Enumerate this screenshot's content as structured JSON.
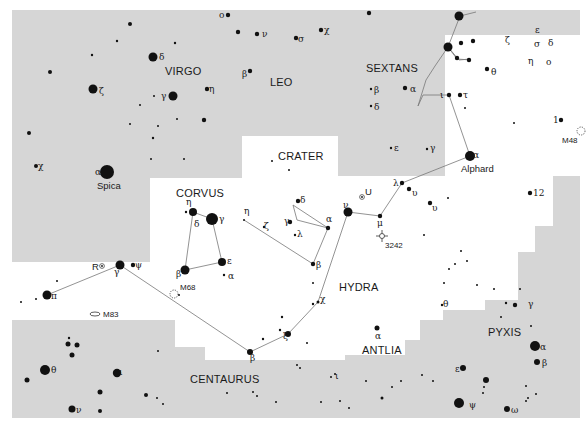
{
  "map": {
    "colors": {
      "outside_region": "#d6d6d6",
      "inside_region": "#ffffff",
      "star": "#111111",
      "figure_line": "#777777",
      "text": "#1a1a1a"
    },
    "constellation_labels": [
      {
        "id": "virgo",
        "text": "VIRGO"
      },
      {
        "id": "leo",
        "text": "LEO"
      },
      {
        "id": "sextans",
        "text": "SEXTANS"
      },
      {
        "id": "crater",
        "text": "CRATER"
      },
      {
        "id": "corvus",
        "text": "CORVUS"
      },
      {
        "id": "hydra",
        "text": "HYDRA"
      },
      {
        "id": "antlia",
        "text": "ANTLIA"
      },
      {
        "id": "pyxis",
        "text": "PYXIS"
      },
      {
        "id": "centaurus",
        "text": "CENTAURUS"
      }
    ],
    "named_stars": [
      {
        "id": "spica",
        "text": "Spica"
      },
      {
        "id": "alphard",
        "text": "Alphard"
      }
    ],
    "deep_sky_objects": [
      {
        "id": "m48",
        "text": "M48",
        "type": "open-cluster"
      },
      {
        "id": "m68",
        "text": "M68",
        "type": "globular-cluster"
      },
      {
        "id": "m83",
        "text": "M83",
        "type": "galaxy"
      },
      {
        "id": "ngc3242",
        "text": "3242",
        "type": "planetary-nebula"
      }
    ],
    "variable_stars": [
      {
        "id": "r-hya",
        "text": "R"
      },
      {
        "id": "u-hya",
        "text": "U"
      }
    ],
    "star_labels": {
      "virgo_delta": "δ",
      "virgo_zeta": "ζ",
      "virgo_gamma": "γ",
      "virgo_eta": "η",
      "virgo_chi": "χ",
      "virgo_alpha": "α",
      "leo_o": "o",
      "leo_nu": "ν",
      "leo_sigma": "σ",
      "leo_chi": "χ",
      "leo_beta": "β",
      "sex_beta": "β",
      "sex_delta": "δ",
      "sex_alpha": "α",
      "sex_epsilon": "ε",
      "sex_gamma": "γ",
      "hya_zeta": "ζ",
      "hya_epsilon": "ε",
      "hya_sigma": "σ",
      "hya_delta": "δ",
      "hya_eta": "η",
      "hya_omicron": "o",
      "hya_theta": "θ",
      "hya_iota": "ι",
      "hya_tau": "τ",
      "hya_alpha": "α",
      "hya_lambda": "λ",
      "hya_upsilon2": "υ",
      "hya_upsilon1": "υ",
      "hya_mu": "μ",
      "hya_12": "12",
      "hya_1": "1",
      "hya_nu": "ν",
      "hya_chi": "χ",
      "hya_xi": "ξ",
      "hya_beta": "β",
      "hya_gamma": "γ",
      "hya_pi": "π",
      "hya_psi": "ψ",
      "crt_delta": "δ",
      "crt_gamma": "γ",
      "crt_alpha": "α",
      "crt_lambda": "λ",
      "crt_eta": "η",
      "crt_zeta": "ζ",
      "crt_beta": "β",
      "crv_eta": "η",
      "crv_delta": "δ",
      "crv_gamma": "γ",
      "crv_beta": "β",
      "crv_epsilon": "ε",
      "crv_alpha": "α",
      "ant_alpha": "α",
      "ant_theta": "θ",
      "ant_epsilon": "ε",
      "pyx_gamma": "γ",
      "pyx_alpha": "α",
      "pyx_beta": "β",
      "vel_psi": "ψ",
      "vel_omega": "ω",
      "cen_theta": "θ",
      "cen_iota": "ι",
      "cen_nu": "ν",
      "cen_iota2": "ι"
    }
  }
}
